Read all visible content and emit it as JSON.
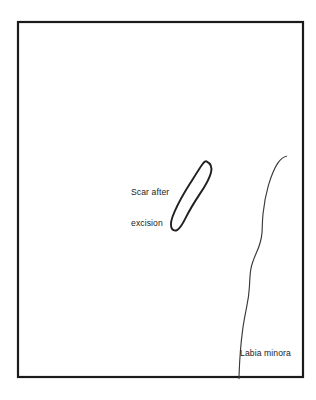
{
  "figure": {
    "background_color": "#ffffff",
    "frame": {
      "stroke_color": "#1b1b1b",
      "stroke_width": 2.2,
      "x": 18,
      "y": 22,
      "width": 285,
      "height": 355
    }
  },
  "labels": {
    "scar": {
      "line1": "Scar after",
      "line2": "excision",
      "x": 131,
      "y": 166,
      "color": "#1b1b1b"
    },
    "labia": {
      "text": "Labia minora",
      "x": 240,
      "y": 348,
      "color": "#1b1b1b"
    }
  },
  "shapes": {
    "scar_loop": {
      "name": "scar-after-excision-outline",
      "stroke_color": "#231f20",
      "stroke_width": 1.9,
      "bbox": {
        "x": 171,
        "y": 160,
        "width": 42,
        "height": 71
      },
      "path": "M 206.5 161.4 C 210.6 163.4 212.2 167.5 211.0 172.4 C 209.5 178.6 205.4 185.6 200.2 193.4 C 194.6 201.8 189.2 210.8 185.4 218.4 C 182.8 223.6 180.6 228.0 177.4 229.8 C 174.6 231.4 172.0 230.2 171.2 227.0 C 170.2 223.0 171.9 217.6 174.6 211.6 C 178.6 202.6 184.4 192.4 190.0 183.6 C 195.0 175.6 199.4 168.4 202.4 164.2 C 203.9 162.1 205.1 160.7 206.5 161.4 Z"
    },
    "labia_minora_curve": {
      "name": "labia-minora-outline",
      "stroke_color": "#3a3a3a",
      "stroke_width": 1.15,
      "path": "M 286.4 156.2 C 283.0 157.0 280.2 159.4 277.6 163.4 C 274.0 169.0 271.0 176.6 268.4 185.4 C 265.8 194.4 264.0 204.4 263.0 214.0 C 262.2 221.6 262.4 227.4 262.0 232.6 C 261.4 240.2 259.2 246.6 256.4 252.8 C 254.0 258.2 251.8 263.6 250.8 269.4 C 249.8 275.2 249.8 281.0 249.4 287.0 C 249.0 293.8 248.0 300.6 246.6 307.4 C 245.2 314.4 243.8 321.4 242.8 328.6 C 241.8 336.0 241.0 343.6 240.4 351.0 C 239.8 358.6 239.4 366.0 239.2 372.0 C 239.1 375.0 239.0 377.0 239.0 378.6"
    }
  }
}
